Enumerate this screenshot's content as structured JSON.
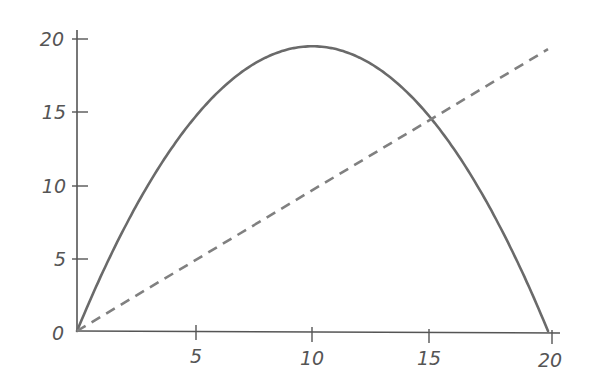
{
  "chart_data": {
    "type": "line",
    "title": "",
    "xlabel": "",
    "ylabel": "",
    "xlim": [
      0,
      20
    ],
    "ylim": [
      0,
      20
    ],
    "grid": false,
    "legend": null,
    "x_ticks": [
      "5",
      "10",
      "15",
      "20"
    ],
    "y_ticks": [
      "0",
      "5",
      "10",
      "15",
      "20"
    ],
    "origin_label": "0",
    "series": [
      {
        "name": "parabola",
        "style": "solid",
        "color": "#6a6a6a",
        "formula": "y = 0.195 * x * (20 - x)",
        "x": [
          0,
          2,
          4,
          6,
          8,
          10,
          12,
          14,
          16,
          18,
          20
        ],
        "values": [
          0,
          7.0,
          12.5,
          16.4,
          18.7,
          19.5,
          18.7,
          16.4,
          12.5,
          7.0,
          0
        ]
      },
      {
        "name": "line",
        "style": "dashed",
        "color": "#808080",
        "formula": "y = x",
        "x": [
          0,
          20
        ],
        "values": [
          0,
          19.3
        ]
      }
    ],
    "annotations": []
  },
  "plot": {
    "x0_px": 77,
    "x20_px": 548,
    "y0_px": 331,
    "y20_px": 39
  }
}
